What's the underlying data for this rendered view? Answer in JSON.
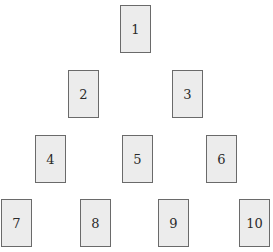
{
  "diagram": {
    "type": "pyramid-of-cards",
    "rows": [
      {
        "cards": [
          {
            "label": "1",
            "x": 120,
            "y": 5
          }
        ]
      },
      {
        "cards": [
          {
            "label": "2",
            "x": 68,
            "y": 70
          },
          {
            "label": "3",
            "x": 172,
            "y": 70
          }
        ]
      },
      {
        "cards": [
          {
            "label": "4",
            "x": 35,
            "y": 135
          },
          {
            "label": "5",
            "x": 122,
            "y": 135
          },
          {
            "label": "6",
            "x": 206,
            "y": 135
          }
        ]
      },
      {
        "cards": [
          {
            "label": "7",
            "x": 1,
            "y": 199
          },
          {
            "label": "8",
            "x": 80,
            "y": 199
          },
          {
            "label": "9",
            "x": 158,
            "y": 199
          },
          {
            "label": "10",
            "x": 239,
            "y": 199
          }
        ]
      }
    ],
    "colors": {
      "card_fill": "#ececec",
      "card_border": "#6a6a6a",
      "text": "#2a2a2a",
      "background": "#ffffff"
    }
  }
}
